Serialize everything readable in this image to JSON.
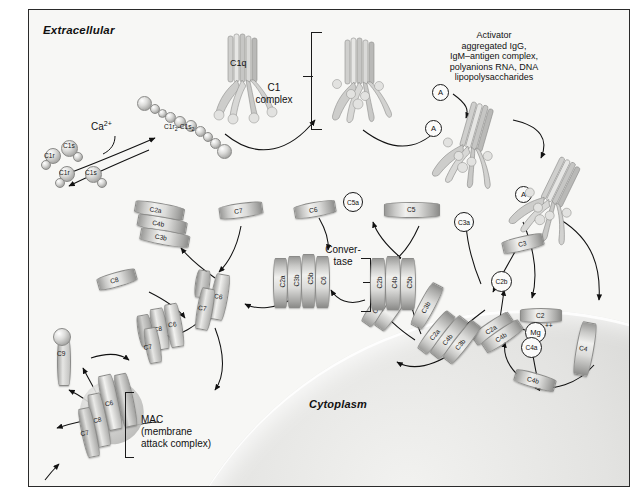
{
  "figure": {
    "title_extracellular": "Extracellular",
    "title_cytoplasm": "Cytoplasm"
  },
  "activator": {
    "lines": [
      "Activator",
      "aggregated IgG,",
      "IgM–antigen complex,",
      "polyanions RNA, DNA",
      "lipopolysaccharides"
    ]
  },
  "labels": {
    "c1q": "C1q",
    "c1r2c1s2_main": "C1r",
    "c1r2c1s2_sub1": "2",
    "c1r2c1s2_mid": "-C1s",
    "c1r2c1s2_sub2": "2",
    "calcium": "Ca",
    "calcium_sup": "2+",
    "c1_complex_l1": "C1",
    "c1_complex_l2": "complex",
    "convertase_l1": "Conver-",
    "convertase_l2": "tase",
    "mac_l1": "MAC",
    "mac_l2": "(membrane",
    "mac_l3": "attack complex)",
    "magnesium": "Mg",
    "magnesium_sup": "++"
  },
  "monomers": {
    "c1r_a": "C1r",
    "c1s_a": "C1s",
    "c1r_b": "C1r",
    "c1s_b": "C1s"
  },
  "circles": [
    {
      "name": "activator-circle-1",
      "text": "A"
    },
    {
      "name": "activator-circle-2",
      "text": "A"
    },
    {
      "name": "activator-circle-3",
      "text": "A"
    },
    {
      "name": "c5a-circle",
      "text": "C5a"
    },
    {
      "name": "c3a-circle",
      "text": "C3a"
    },
    {
      "name": "c2b-circle",
      "text": "C2b"
    },
    {
      "name": "c4a-circle",
      "text": "C4a"
    }
  ],
  "free_proteins": [
    {
      "name": "c2-cylinder",
      "label": "C2"
    },
    {
      "name": "c3-cylinder",
      "label": "C3"
    },
    {
      "name": "c4-cylinder",
      "label": "C4"
    },
    {
      "name": "c5-cylinder",
      "label": "C5"
    },
    {
      "name": "c6-cylinder",
      "label": "C6"
    },
    {
      "name": "c7-cylinder",
      "label": "C7"
    },
    {
      "name": "c8-cylinder",
      "label": "C8"
    },
    {
      "name": "c9-protein",
      "label": "C9"
    },
    {
      "name": "c4b-bound",
      "label": "C4b"
    }
  ],
  "complexes": {
    "c3_convertase_classical": [
      "C2a",
      "C4b"
    ],
    "c5_convertase_classical": [
      "C2a",
      "C4b",
      "C3b"
    ],
    "c5_convertase_stack": [
      "C2a",
      "C3b"
    ],
    "convertase_left": [
      "C2a",
      "C3b",
      "C5b",
      "C6"
    ],
    "convertase_right": [
      "C2b",
      "C4b",
      "C5b"
    ],
    "released_stack": [
      "C2a",
      "C4b",
      "C3b"
    ],
    "mac_intermediate_1": [
      "C6",
      "C7"
    ],
    "mac_intermediate_2": [
      "C8",
      "C6",
      "C7"
    ],
    "mac_membrane": [
      "C6",
      "C8",
      "C7"
    ]
  }
}
